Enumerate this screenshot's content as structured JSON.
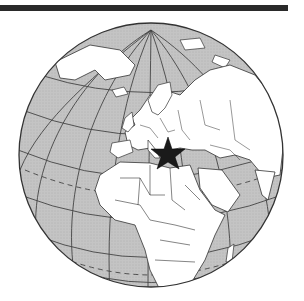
{
  "map": {
    "title": "Orthographic globe centered on Europe",
    "projection": "orthographic",
    "marker": {
      "type": "star",
      "label": "Black Sea / Southeastern Europe"
    },
    "colors": {
      "ocean": "#c8c8c8",
      "land": "#ffffff",
      "outline": "#333333",
      "marker": "#1a1a1a",
      "bar": "#2a2a2a"
    },
    "regions_visible": [
      "Greenland",
      "Arctic Ocean",
      "Scandinavia",
      "Europe",
      "Russia",
      "Middle East",
      "Africa",
      "Arabian Peninsula",
      "Atlantic Ocean",
      "Mediterranean Sea",
      "Indian Ocean"
    ]
  }
}
